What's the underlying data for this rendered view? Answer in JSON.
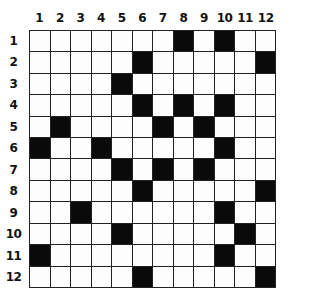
{
  "puzzle": {
    "type": "crossword-grid",
    "rows": 12,
    "cols": 12,
    "column_labels": [
      "1",
      "2",
      "3",
      "4",
      "5",
      "6",
      "7",
      "8",
      "9",
      "10",
      "11",
      "12"
    ],
    "row_labels": [
      "1",
      "2",
      "3",
      "4",
      "5",
      "6",
      "7",
      "8",
      "9",
      "10",
      "11",
      "12"
    ],
    "black_cells": {
      "1": [
        8,
        10
      ],
      "2": [
        6,
        12
      ],
      "3": [
        5
      ],
      "4": [
        6,
        8,
        10
      ],
      "5": [
        2,
        7,
        9
      ],
      "6": [
        1,
        4,
        10
      ],
      "7": [
        5,
        7,
        9
      ],
      "8": [
        6,
        12
      ],
      "9": [
        3,
        10
      ],
      "10": [
        5,
        11
      ],
      "11": [
        1,
        10
      ],
      "12": [
        6,
        12
      ]
    },
    "colors": {
      "black": "#0a0a0a",
      "white": "#fdfdfd",
      "line": "#222222"
    }
  }
}
